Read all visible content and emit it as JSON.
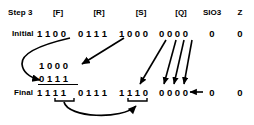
{
  "figure": {
    "step_label": "Step 3",
    "row_labels": {
      "initial": "Initial",
      "final": "Final"
    },
    "column_headers": {
      "f": "[F]",
      "r": "[R]",
      "s": "[S]",
      "q": "[Q]",
      "sio3": "SIO3",
      "z": "Z"
    },
    "initial_row": {
      "f": "1 1 0 0",
      "r": "0 1 1 1",
      "s": "1 0 0 0",
      "q": "0 0 0 0",
      "sio3": "0",
      "z": "0"
    },
    "work_rows": {
      "operand_top": "1 0 0 0",
      "operand_bottom": "0 1 1 1"
    },
    "final_row": {
      "f": "1 1 1 1",
      "r": "0 1 1 1",
      "s": "1 1 1 0",
      "q": "0 0 0 0",
      "sio3_in": "0",
      "z": "0"
    },
    "colors": {
      "ink": "#000000",
      "background": "#ffffff"
    },
    "annotations": {
      "arrow_f_to_operand_bottom": "curved-arrow-f-initial-to-addend",
      "arrow_s_to_operand_top": "diagonal-arrow-s-initial-to-augend",
      "arrows_q_down": "four-diagonal-arrows-q-shift-down",
      "arrow_sio3_into_q": "horizontal-left-arrow-sio3-into-q-final",
      "arrow_f_final_to_s_final": "curved-arrow-f-final-to-s-final"
    }
  }
}
